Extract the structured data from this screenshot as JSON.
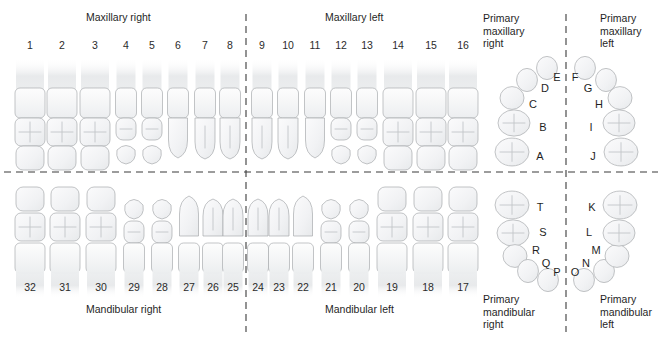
{
  "figure": {
    "kind": "dental-arch-tooth-numbering-chart",
    "background_color": "#ffffff",
    "line_color": "#3b3b3b",
    "tooth_outline_color": "#a9acaf"
  },
  "quadrant_titles": {
    "maxillary_right": "Maxillary right",
    "maxillary_left": "Maxillary left",
    "mandibular_right": "Mandibular right",
    "mandibular_left": "Mandibular left"
  },
  "primary_titles": {
    "maxillary_right": [
      "Primary",
      "maxillary",
      "right"
    ],
    "maxillary_left": [
      "Primary",
      "maxillary",
      "left"
    ],
    "mandibular_right": [
      "Primary",
      "mandibular",
      "right"
    ],
    "mandibular_left": [
      "Primary",
      "mandibular",
      "left"
    ]
  },
  "permanent": {
    "maxillary": {
      "right": [
        {
          "n": "1",
          "x": 30,
          "type": "molar"
        },
        {
          "n": "2",
          "x": 62,
          "type": "molar"
        },
        {
          "n": "3",
          "x": 95,
          "type": "molar"
        },
        {
          "n": "4",
          "x": 126,
          "type": "premolar"
        },
        {
          "n": "5",
          "x": 152,
          "type": "premolar"
        },
        {
          "n": "6",
          "x": 178,
          "type": "canine"
        },
        {
          "n": "7",
          "x": 205,
          "type": "incisor"
        },
        {
          "n": "8",
          "x": 230,
          "type": "incisor"
        }
      ],
      "left": [
        {
          "n": "9",
          "x": 262,
          "type": "incisor"
        },
        {
          "n": "10",
          "x": 288,
          "type": "incisor"
        },
        {
          "n": "11",
          "x": 315,
          "type": "canine"
        },
        {
          "n": "12",
          "x": 341,
          "type": "premolar"
        },
        {
          "n": "13",
          "x": 367,
          "type": "premolar"
        },
        {
          "n": "14",
          "x": 398,
          "type": "molar"
        },
        {
          "n": "15",
          "x": 431,
          "type": "molar"
        },
        {
          "n": "16",
          "x": 463,
          "type": "molar"
        }
      ]
    },
    "mandibular": {
      "right": [
        {
          "n": "32",
          "x": 30,
          "type": "molar"
        },
        {
          "n": "31",
          "x": 65,
          "type": "molar"
        },
        {
          "n": "30",
          "x": 101,
          "type": "molar"
        },
        {
          "n": "29",
          "x": 134,
          "type": "premolar"
        },
        {
          "n": "28",
          "x": 162,
          "type": "premolar"
        },
        {
          "n": "27",
          "x": 189,
          "type": "canine"
        },
        {
          "n": "26",
          "x": 213,
          "type": "incisor"
        },
        {
          "n": "25",
          "x": 233,
          "type": "incisor"
        }
      ],
      "left": [
        {
          "n": "24",
          "x": 258,
          "type": "incisor"
        },
        {
          "n": "23",
          "x": 279,
          "type": "incisor"
        },
        {
          "n": "22",
          "x": 303,
          "type": "canine"
        },
        {
          "n": "21",
          "x": 331,
          "type": "premolar"
        },
        {
          "n": "20",
          "x": 359,
          "type": "premolar"
        },
        {
          "n": "19",
          "x": 392,
          "type": "molar"
        },
        {
          "n": "18",
          "x": 428,
          "type": "molar"
        },
        {
          "n": "17",
          "x": 463,
          "type": "molar"
        }
      ]
    }
  },
  "primary": {
    "maxillary": {
      "right": [
        {
          "id": "A",
          "lx": 540,
          "ly": 156,
          "tx": 512,
          "ty": 152,
          "r": 17,
          "kind": "molar"
        },
        {
          "id": "B",
          "lx": 543,
          "ly": 127,
          "tx": 514,
          "ty": 123,
          "r": 16,
          "kind": "molar"
        },
        {
          "id": "C",
          "lx": 533,
          "ly": 104,
          "tx": 512,
          "ty": 98,
          "r": 12,
          "kind": "canine"
        },
        {
          "id": "D",
          "lx": 545,
          "ly": 88,
          "tx": 527,
          "ty": 80,
          "r": 11,
          "kind": "incisor"
        },
        {
          "id": "E",
          "lx": 557,
          "ly": 77,
          "tx": 547,
          "ty": 68,
          "r": 11,
          "kind": "incisor"
        }
      ],
      "left": [
        {
          "id": "F",
          "lx": 575,
          "ly": 77,
          "tx": 585,
          "ty": 68,
          "r": 11,
          "kind": "incisor"
        },
        {
          "id": "G",
          "lx": 588,
          "ly": 88,
          "tx": 606,
          "ty": 80,
          "r": 11,
          "kind": "incisor"
        },
        {
          "id": "H",
          "lx": 599,
          "ly": 104,
          "tx": 620,
          "ty": 98,
          "r": 12,
          "kind": "canine"
        },
        {
          "id": "I",
          "lx": 591,
          "ly": 127,
          "tx": 619,
          "ty": 123,
          "r": 16,
          "kind": "molar"
        },
        {
          "id": "J",
          "lx": 593,
          "ly": 156,
          "tx": 621,
          "ty": 152,
          "r": 17,
          "kind": "molar"
        }
      ]
    },
    "mandibular": {
      "right": [
        {
          "id": "T",
          "lx": 540,
          "ly": 207,
          "tx": 512,
          "ty": 205,
          "r": 17,
          "kind": "molar"
        },
        {
          "id": "S",
          "lx": 543,
          "ly": 232,
          "tx": 513,
          "ty": 233,
          "r": 16,
          "kind": "molar"
        },
        {
          "id": "R",
          "lx": 536,
          "ly": 250,
          "tx": 515,
          "ty": 256,
          "r": 12,
          "kind": "canine"
        },
        {
          "id": "Q",
          "lx": 546,
          "ly": 263,
          "tx": 528,
          "ty": 271,
          "r": 11,
          "kind": "incisor"
        },
        {
          "id": "P",
          "lx": 557,
          "ly": 272,
          "tx": 548,
          "ty": 280,
          "r": 11,
          "kind": "incisor"
        }
      ],
      "left": [
        {
          "id": "O",
          "lx": 575,
          "ly": 272,
          "tx": 584,
          "ty": 280,
          "r": 11,
          "kind": "incisor"
        },
        {
          "id": "N",
          "lx": 586,
          "ly": 263,
          "tx": 604,
          "ty": 271,
          "r": 11,
          "kind": "incisor"
        },
        {
          "id": "M",
          "lx": 596,
          "ly": 250,
          "tx": 617,
          "ty": 256,
          "r": 12,
          "kind": "canine"
        },
        {
          "id": "L",
          "lx": 589,
          "ly": 232,
          "tx": 619,
          "ty": 233,
          "r": 16,
          "kind": "molar"
        },
        {
          "id": "K",
          "lx": 592,
          "ly": 207,
          "tx": 620,
          "ty": 205,
          "r": 17,
          "kind": "molar"
        }
      ]
    }
  },
  "dividers": {
    "horizontal_y": 172,
    "vertical_permanent_x": 246,
    "vertical_primary_x": 566
  }
}
